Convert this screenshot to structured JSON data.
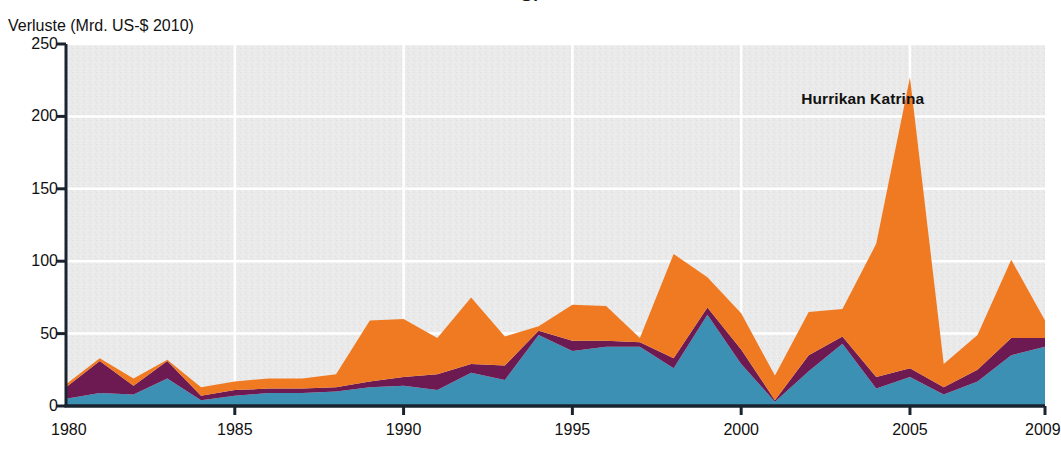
{
  "figure": {
    "top_cut_caption": "G.",
    "ylabel": "Verluste (Mrd. US-$ 2010)",
    "annotation": "Hurrikan Katrina"
  },
  "colors": {
    "blue": "#3C90B4",
    "purple": "#6E1A52",
    "orange": "#F07A22",
    "plot_background": "#EAEAEA",
    "gridline": "#FFFFFF",
    "axis": "#1A2430",
    "text": "#111111"
  },
  "chart_data": {
    "type": "area",
    "stacked": true,
    "title": "",
    "xlabel": "",
    "ylabel": "Verluste (Mrd. US-$ 2010)",
    "xlim": [
      1980,
      2009
    ],
    "ylim": [
      0,
      250
    ],
    "yticks": [
      0,
      50,
      100,
      150,
      200,
      250
    ],
    "xticks": [
      1980,
      1985,
      1990,
      1995,
      2000,
      2005,
      2009
    ],
    "grid": "horizontal-and-vertical-white",
    "legend": "none",
    "annotations": [
      {
        "text": "Hurrikan Katrina",
        "x": 2003.6,
        "y": 212
      }
    ],
    "x": [
      1980,
      1981,
      1982,
      1983,
      1984,
      1985,
      1986,
      1987,
      1988,
      1989,
      1990,
      1991,
      1992,
      1993,
      1994,
      1995,
      1996,
      1997,
      1998,
      1999,
      2000,
      2001,
      2002,
      2003,
      2004,
      2005,
      2006,
      2007,
      2008,
      2009
    ],
    "series": [
      {
        "name": "untere Schicht (blau)",
        "color": "#3C90B4",
        "values": [
          5,
          9,
          8,
          19,
          4,
          7,
          9,
          9,
          10,
          13,
          14,
          11,
          23,
          18,
          49,
          38,
          41,
          41,
          26,
          63,
          29,
          3,
          24,
          43,
          12,
          20,
          8,
          17,
          35,
          41
        ]
      },
      {
        "name": "mittlere Schicht (violett)",
        "color": "#6E1A52",
        "values": [
          8,
          22,
          6,
          12,
          3,
          4,
          3,
          3,
          3,
          4,
          6,
          11,
          6,
          10,
          3,
          7,
          4,
          3,
          7,
          5,
          10,
          1,
          11,
          5,
          8,
          6,
          5,
          8,
          12,
          6
        ]
      },
      {
        "name": "obere Schicht (orange)",
        "color": "#F07A22",
        "values": [
          2,
          2,
          5,
          1,
          6,
          6,
          7,
          7,
          9,
          42,
          40,
          25,
          46,
          20,
          3,
          25,
          24,
          3,
          72,
          21,
          25,
          17,
          30,
          19,
          92,
          201,
          16,
          24,
          54,
          12
        ]
      }
    ],
    "totals": [
      15,
      33,
      19,
      32,
      13,
      17,
      19,
      19,
      22,
      59,
      60,
      47,
      75,
      48,
      55,
      70,
      69,
      47,
      105,
      89,
      64,
      21,
      65,
      67,
      112,
      227,
      29,
      49,
      101,
      59
    ]
  }
}
